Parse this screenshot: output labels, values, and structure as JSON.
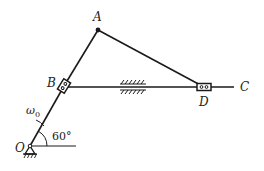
{
  "diagram": {
    "type": "planar mechanism (crank-slider linkage)",
    "points": {
      "A": {
        "label": "A",
        "x": 98,
        "y": 30
      },
      "B": {
        "label": "B",
        "x": 64,
        "y": 86
      },
      "C": {
        "label": "C",
        "x": 234,
        "y": 87
      },
      "D": {
        "label": "D",
        "x": 204,
        "y": 87
      },
      "O": {
        "label": "O",
        "x": 30,
        "y": 146
      }
    },
    "links": [
      {
        "from": "O",
        "to": "B"
      },
      {
        "from": "B",
        "to": "A"
      },
      {
        "from": "A",
        "to": "D"
      },
      {
        "from": "B",
        "to": "C"
      }
    ],
    "annotations": {
      "omega": "ω",
      "omega_sub": "0",
      "angle": "60°"
    },
    "colors": {
      "line": "#1a1a1a",
      "background": "#ffffff"
    }
  }
}
